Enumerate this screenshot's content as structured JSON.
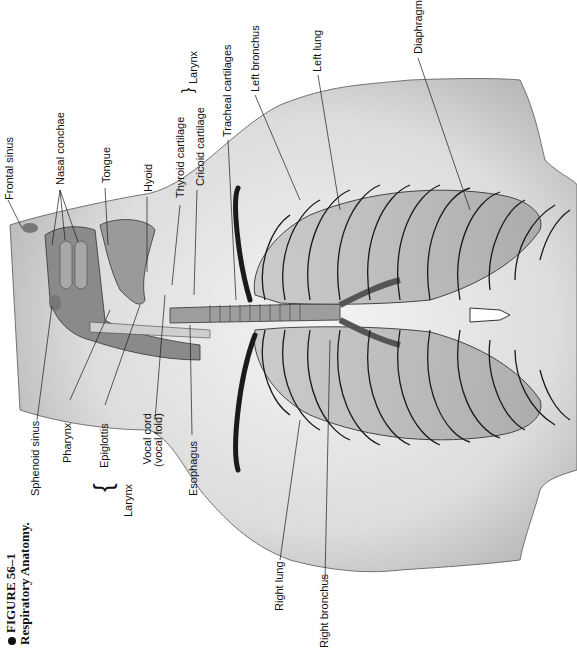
{
  "caption": {
    "figure_number": "FIGURE 56–1",
    "title": "Respiratory Anatomy."
  },
  "labels": {
    "frontal_sinus": "Frontal sinus",
    "nasal_conchae": "Nasal conchae",
    "tongue": "Tongue",
    "hyoid": "Hyoid",
    "thyroid_cartilage": "Thyroid cartilage",
    "cricoid_cartilage": "Cricoid cartilage",
    "larynx_top": "Larynx",
    "tracheal_cartilages": "Tracheal cartilages",
    "left_bronchus": "Left bronchus",
    "left_lung": "Left lung",
    "diaphragm": "Diaphragm",
    "sphenoid_sinus": "Sphenoid sinus",
    "pharynx": "Pharynx",
    "epiglottis": "Epiglottis",
    "vocal_cord_line1": "Vocal cord",
    "vocal_cord_line2": "(vocal fold)",
    "larynx_bottom": "Larynx",
    "esophagus": "Esophagus",
    "right_lung": "Right lung",
    "right_bronchus": "Right bronchus"
  },
  "colors": {
    "skin": "#e4e4e4",
    "tissue": "#8a8a8a",
    "lung": "#b8b8b8",
    "line": "#1a1a1a"
  }
}
